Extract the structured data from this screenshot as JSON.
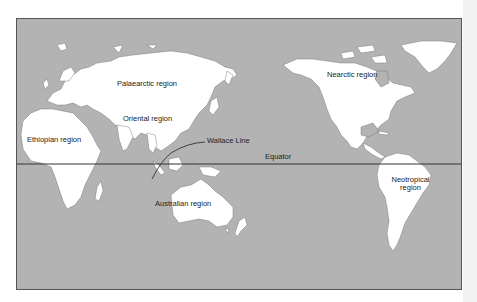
{
  "map": {
    "title": "Zoogeographic regions of the world",
    "colors": {
      "ocean": "#b3b3b3",
      "land": "#ffffff",
      "border": "#555555",
      "lines": "#333333",
      "text": "#222222"
    },
    "labels": {
      "palaearctic": "Palaearctic region",
      "oriental": "Oriental region",
      "ethiopian": "Ethiopian region",
      "wallace_line": "Wallace Line",
      "equator": "Equator",
      "nearctic": "Nearctic region",
      "australian": "Australian region",
      "neotropical_line1": "Neotropical",
      "neotropical_line2": "region"
    },
    "regions": [
      "Palaearctic",
      "Oriental",
      "Ethiopian",
      "Australian",
      "Nearctic",
      "Neotropical"
    ],
    "lines": [
      "Equator",
      "Wallace Line"
    ]
  }
}
